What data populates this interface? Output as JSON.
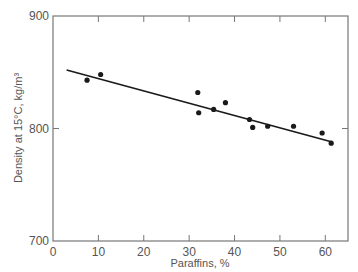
{
  "chart_data": {
    "type": "scatter",
    "title": "",
    "xlabel": "Paraffins, %",
    "ylabel": "Density at 15°C, kg/m³",
    "xlim": [
      0,
      65
    ],
    "ylim": [
      700,
      900
    ],
    "xticks": [
      0,
      10,
      20,
      30,
      40,
      50,
      60
    ],
    "yticks": [
      700,
      800,
      900
    ],
    "xtick_labels": [
      "0",
      "10",
      "20",
      "30",
      "40",
      "50",
      "60"
    ],
    "ytick_labels": [
      "700",
      "800",
      "900"
    ],
    "grid": false,
    "legend": null,
    "series": [
      {
        "name": "Samples",
        "kind": "scatter",
        "color": "#1a1a1a",
        "x": [
          7.5,
          10.5,
          31.9,
          32.1,
          35.4,
          38.0,
          43.3,
          44.0,
          47.3,
          53.0,
          59.3,
          61.3
        ],
        "y": [
          843,
          848,
          832,
          814,
          817,
          823,
          808,
          801,
          802,
          802,
          796,
          787
        ]
      },
      {
        "name": "Linear fit",
        "kind": "line",
        "color": "#1a1a1a",
        "x": [
          3,
          61.5
        ],
        "y": [
          852,
          788
        ]
      }
    ]
  }
}
